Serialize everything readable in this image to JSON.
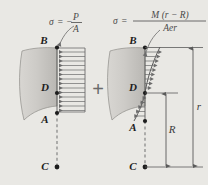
{
  "figure": {
    "background_color": "#e9e8e4",
    "operator": "+",
    "left_panel": {
      "name": "axial-normal-stress",
      "formula": {
        "sigma": "σ",
        "equals": "=",
        "minus": "−",
        "numerator": "P",
        "denominator": "A",
        "full": "σ = −P/A"
      },
      "points": [
        {
          "label": "B",
          "role": "outer-fiber-top"
        },
        {
          "label": "D",
          "role": "neutral-axis"
        },
        {
          "label": "A",
          "role": "inner-fiber"
        },
        {
          "label": "C",
          "role": "center-of-curvature"
        }
      ],
      "distribution": {
        "type": "uniform",
        "direction": "left",
        "arrow_count": 14
      }
    },
    "right_panel": {
      "name": "bending-stress",
      "formula": {
        "sigma": "σ",
        "equals": "=",
        "numerator": "M (r − R)",
        "denominator": "Aer",
        "full": "σ = M(r − R)/(Aer)"
      },
      "points": [
        {
          "label": "B",
          "role": "outer-fiber-top"
        },
        {
          "label": "D",
          "role": "neutral-axis"
        },
        {
          "label": "A",
          "role": "inner-fiber"
        },
        {
          "label": "C",
          "role": "center-of-curvature"
        }
      ],
      "dimensions": [
        {
          "label": "R",
          "role": "neutral-axis-radius",
          "from": "C",
          "to": "D"
        },
        {
          "label": "r",
          "role": "outer-radius",
          "from": "C",
          "to": "B"
        }
      ],
      "distribution": {
        "type": "hyperbolic",
        "tension_direction": "right",
        "compression_direction": "left",
        "arrow_count": 14
      }
    },
    "colors": {
      "line": "#4a4a4a",
      "label": "#1d1d1d",
      "section_fill": "#c9c7c3",
      "background": "#e9e8e4"
    }
  }
}
